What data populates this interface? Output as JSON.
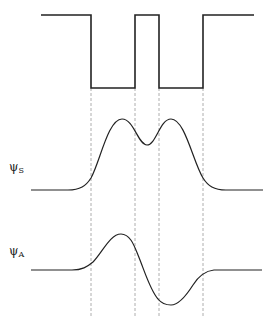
{
  "diagram": {
    "labels": {
      "psi_s": {
        "symbol": "ψ",
        "subscript": "S"
      },
      "psi_a": {
        "symbol": "ψ",
        "subscript": "A"
      }
    },
    "colors": {
      "line": "#222222",
      "dashed": "#999999",
      "background": "#ffffff"
    },
    "well_boundaries_x": [
      91,
      135,
      159,
      203
    ],
    "potential": {
      "top_y": 15,
      "bottom_y": 88,
      "x_start": 41,
      "x_end": 254
    },
    "psi_s": {
      "baseline_y": 190,
      "peaks": [
        [
          122,
          119
        ],
        [
          171,
          119
        ]
      ],
      "dip": [
        147,
        145
      ]
    },
    "psi_a": {
      "baseline_y": 270,
      "max": [
        121,
        234
      ],
      "min": [
        171,
        305
      ],
      "node_x": 147
    }
  }
}
